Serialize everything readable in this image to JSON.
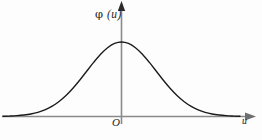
{
  "figure": {
    "background_color": "#fdfdfd",
    "curve_color": "#1a1a1a",
    "axis_color": "#8a8a8a",
    "label_color": "#1d1d1d",
    "y_axis_label": "φ (u)",
    "y_axis_label_phi": "φ",
    "y_axis_label_arg": " (u)",
    "origin_label": "O",
    "x_axis_label": "u"
  },
  "chart_data": {
    "type": "line",
    "title": "",
    "subtitle": "",
    "xlabel": "u",
    "ylabel": "φ (u)",
    "grid": false,
    "legend": null,
    "annotations": [
      {
        "text": "O",
        "role": "origin-marker",
        "x": 0,
        "y": 0
      }
    ],
    "axes": {
      "x": {
        "range": [
          -3.4,
          3.4
        ],
        "arrow": true,
        "ticks": [],
        "ticklabels": []
      },
      "y": {
        "range": [
          0,
          1.28
        ],
        "arrow": true,
        "ticks": [],
        "ticklabels": []
      }
    },
    "series": [
      {
        "name": "standard normal density",
        "function": "phi(u) = exp(-u^2/2)",
        "x": [
          -3.4,
          -3.2,
          -3.0,
          -2.8,
          -2.6,
          -2.4,
          -2.2,
          -2.0,
          -1.8,
          -1.6,
          -1.4,
          -1.2,
          -1.0,
          -0.8,
          -0.6,
          -0.4,
          -0.2,
          0.0,
          0.2,
          0.4,
          0.6,
          0.8,
          1.0,
          1.2,
          1.4,
          1.6,
          1.8,
          2.0,
          2.2,
          2.4,
          2.6,
          2.8,
          3.0,
          3.2,
          3.4
        ],
        "y": [
          0.003,
          0.006,
          0.011,
          0.02,
          0.034,
          0.056,
          0.089,
          0.135,
          0.198,
          0.278,
          0.375,
          0.487,
          0.607,
          0.726,
          0.835,
          0.923,
          0.98,
          1.0,
          0.98,
          0.923,
          0.835,
          0.726,
          0.607,
          0.487,
          0.375,
          0.278,
          0.198,
          0.135,
          0.089,
          0.056,
          0.034,
          0.02,
          0.011,
          0.006,
          0.003
        ]
      }
    ]
  }
}
